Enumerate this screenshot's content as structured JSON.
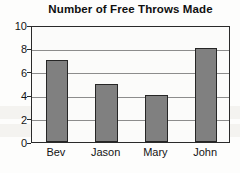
{
  "chart_data": {
    "type": "bar",
    "title": "Number of Free Throws Made",
    "xlabel": "",
    "ylabel": "",
    "categories": [
      "Bev",
      "Jason",
      "Mary",
      "John"
    ],
    "values": [
      7,
      5,
      4,
      8
    ],
    "ylim": [
      0,
      10
    ],
    "ytick_labels": [
      "0",
      "2",
      "4",
      "6",
      "8",
      "10"
    ],
    "ytick_values": [
      0,
      2,
      4,
      6,
      8,
      10
    ],
    "grid": "horizontal",
    "legend": "none",
    "bar_color": "#808080",
    "bar_border_color": "#262626",
    "axis_color": "#2a2a2a",
    "gridline_color": "#8c8c8c",
    "plot_background": "#fbfbfa",
    "title_color": "#101010"
  }
}
